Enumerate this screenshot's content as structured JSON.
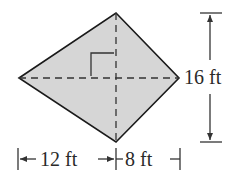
{
  "figure": {
    "shape": "kite",
    "fill_color": "#d6d6d6",
    "stroke_color": "#1a1a1a",
    "diagonals": "dashed, perpendicular",
    "right_angle_marker": true
  },
  "labels": {
    "height": "16 ft",
    "left_width": "12 ft",
    "right_width": "8 ft"
  }
}
